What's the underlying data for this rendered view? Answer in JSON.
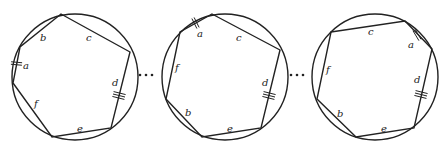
{
  "diagram": {
    "stroke": "#222222",
    "circles": [
      {
        "cx": 75,
        "cy": 77,
        "r": 63,
        "polygon": [
          [
            61,
            14
          ],
          [
            130,
            52
          ],
          [
            111,
            128
          ],
          [
            52,
            137
          ],
          [
            13,
            83
          ],
          [
            20,
            47
          ]
        ],
        "labels": [
          {
            "t": "b",
            "x": 40,
            "y": 41
          },
          {
            "t": "c",
            "x": 86,
            "y": 41
          },
          {
            "t": "a",
            "x": 23,
            "y": 69
          },
          {
            "t": "d",
            "x": 112,
            "y": 86
          },
          {
            "t": "f",
            "x": 34,
            "y": 107
          },
          {
            "t": "e",
            "x": 77,
            "y": 132
          }
        ],
        "ticks": [
          {
            "x1": 11,
            "y1": 63,
            "x2": 22,
            "y2": 64,
            "n": 2
          },
          {
            "x1": 113,
            "y1": 94,
            "x2": 125,
            "y2": 97,
            "n": 3
          }
        ]
      },
      {
        "cx": 225,
        "cy": 77,
        "r": 63,
        "polygon": [
          [
            212,
            14
          ],
          [
            280,
            50
          ],
          [
            261,
            128
          ],
          [
            202,
            137
          ],
          [
            166,
            99
          ],
          [
            180,
            32
          ]
        ],
        "labels": [
          {
            "t": "a",
            "x": 197,
            "y": 37
          },
          {
            "t": "c",
            "x": 236,
            "y": 41
          },
          {
            "t": "f",
            "x": 175,
            "y": 71
          },
          {
            "t": "d",
            "x": 262,
            "y": 86
          },
          {
            "t": "b",
            "x": 185,
            "y": 116
          },
          {
            "t": "e",
            "x": 227,
            "y": 132
          }
        ],
        "ticks": [
          {
            "x1": 193,
            "y1": 18,
            "x2": 198,
            "y2": 28,
            "n": 2
          },
          {
            "x1": 263,
            "y1": 94,
            "x2": 275,
            "y2": 97,
            "n": 3
          }
        ]
      },
      {
        "cx": 375,
        "cy": 77,
        "r": 63,
        "polygon": [
          [
            331,
            32
          ],
          [
            405,
            21
          ],
          [
            432,
            49
          ],
          [
            414,
            128
          ],
          [
            356,
            137
          ],
          [
            317,
            99
          ]
        ],
        "labels": [
          {
            "t": "c",
            "x": 368,
            "y": 35
          },
          {
            "t": "a",
            "x": 408,
            "y": 48
          },
          {
            "t": "f",
            "x": 326,
            "y": 73
          },
          {
            "t": "d",
            "x": 414,
            "y": 83
          },
          {
            "t": "b",
            "x": 337,
            "y": 117
          },
          {
            "t": "e",
            "x": 381,
            "y": 132
          }
        ],
        "ticks": [
          {
            "x1": 414,
            "y1": 30,
            "x2": 420,
            "y2": 40,
            "n": 2
          },
          {
            "x1": 415,
            "y1": 93,
            "x2": 427,
            "y2": 96,
            "n": 3
          }
        ]
      }
    ],
    "ellipses": [
      {
        "x": [
          140,
          146,
          152
        ],
        "y": 75
      },
      {
        "x": [
          291,
          297,
          303
        ],
        "y": 75
      }
    ]
  }
}
